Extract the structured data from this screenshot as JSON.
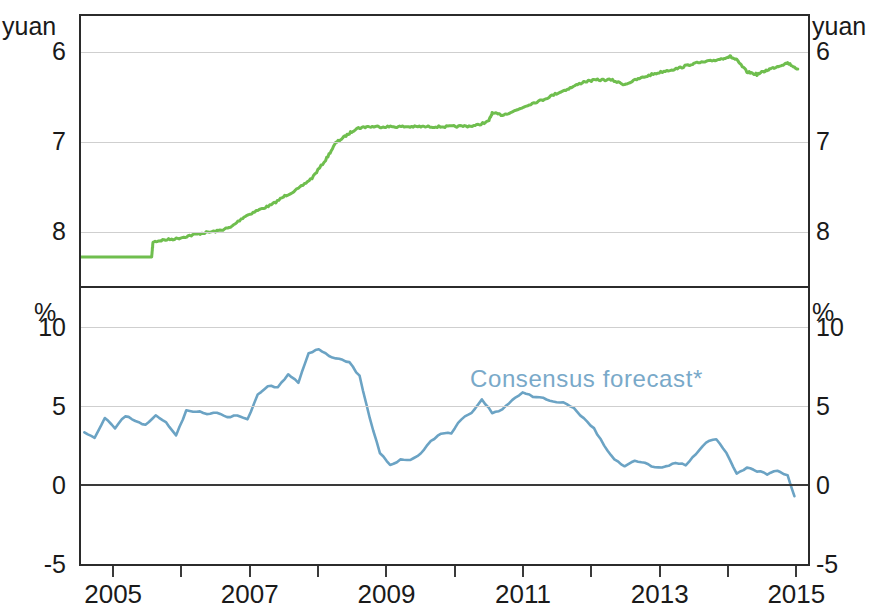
{
  "figure": {
    "left_unit_top": "yuan",
    "right_unit_top": "yuan",
    "left_unit_bottom": "%",
    "right_unit_bottom": "%"
  },
  "panel1": {
    "title": "Spot rate against US$, inverted scale",
    "yticks": [
      "6",
      "7",
      "8"
    ],
    "series_color": "#6fbe4e"
  },
  "panel2": {
    "title": "Appreciation in the next 12 months",
    "yticks": [
      "10",
      "5",
      "0",
      "-5"
    ],
    "legend": "Consensus forecast*",
    "series_color": "#6ba3c4"
  },
  "xaxis": {
    "labels": [
      "2005",
      "2007",
      "2009",
      "2011",
      "2013",
      "2015"
    ]
  },
  "chart_data": [
    {
      "type": "line",
      "title": "Spot rate against US$, inverted scale",
      "xlabel": "",
      "ylabel": "yuan",
      "ylim": [
        8.6,
        5.6
      ],
      "inverted_yaxis": true,
      "yticks": [
        6,
        7,
        8
      ],
      "xlim": [
        2004.5,
        2015.2
      ],
      "grid": true,
      "legend": "none",
      "series": [
        {
          "name": "CNY per US$ spot rate",
          "color": "#6fbe4e",
          "x": [
            2004.5,
            2004.7,
            2004.9,
            2005.1,
            2005.3,
            2005.54,
            2005.56,
            2005.7,
            2005.9,
            2006.1,
            2006.3,
            2006.5,
            2006.7,
            2006.9,
            2007.1,
            2007.3,
            2007.5,
            2007.7,
            2007.9,
            2008.1,
            2008.25,
            2008.4,
            2008.55,
            2008.7,
            2008.9,
            2009.1,
            2009.3,
            2009.5,
            2009.7,
            2009.9,
            2010.1,
            2010.3,
            2010.5,
            2010.55,
            2010.7,
            2010.9,
            2011.1,
            2011.3,
            2011.5,
            2011.7,
            2011.9,
            2012.1,
            2012.3,
            2012.5,
            2012.7,
            2012.9,
            2013.1,
            2013.3,
            2013.5,
            2013.7,
            2013.9,
            2014.05,
            2014.15,
            2014.3,
            2014.45,
            2014.6,
            2014.75,
            2014.9,
            2015.05
          ],
          "y": [
            8.277,
            8.277,
            8.277,
            8.277,
            8.277,
            8.277,
            8.11,
            8.09,
            8.075,
            8.04,
            8.01,
            7.99,
            7.95,
            7.83,
            7.76,
            7.7,
            7.6,
            7.52,
            7.4,
            7.2,
            7.01,
            6.93,
            6.85,
            6.83,
            6.83,
            6.83,
            6.83,
            6.83,
            6.83,
            6.83,
            6.825,
            6.82,
            6.77,
            6.68,
            6.7,
            6.65,
            6.58,
            6.53,
            6.46,
            6.4,
            6.33,
            6.31,
            6.31,
            6.36,
            6.3,
            6.25,
            6.21,
            6.18,
            6.13,
            6.11,
            6.08,
            6.05,
            6.09,
            6.22,
            6.25,
            6.2,
            6.16,
            6.12,
            6.19
          ]
        }
      ]
    },
    {
      "type": "line",
      "title": "Appreciation in the next 12 months",
      "xlabel": "",
      "ylabel": "%",
      "ylim": [
        -5,
        12.5
      ],
      "yticks": [
        -5,
        0,
        5,
        10
      ],
      "xlim": [
        2004.5,
        2015.2
      ],
      "grid": true,
      "zero_line": true,
      "annotations": [
        {
          "text": "Consensus forecast*",
          "x": 2011.3,
          "y": 7.6
        }
      ],
      "series": [
        {
          "name": "Consensus forecast*",
          "color": "#6ba3c4",
          "x": [
            2004.55,
            2004.7,
            2004.85,
            2005.0,
            2005.15,
            2005.3,
            2005.45,
            2005.6,
            2005.75,
            2005.9,
            2006.05,
            2006.2,
            2006.35,
            2006.5,
            2006.65,
            2006.8,
            2006.95,
            2007.1,
            2007.25,
            2007.4,
            2007.55,
            2007.7,
            2007.85,
            2008.0,
            2008.15,
            2008.3,
            2008.45,
            2008.6,
            2008.75,
            2008.9,
            2009.05,
            2009.2,
            2009.35,
            2009.5,
            2009.65,
            2009.8,
            2009.95,
            2010.1,
            2010.25,
            2010.4,
            2010.55,
            2010.7,
            2010.85,
            2011.0,
            2011.15,
            2011.3,
            2011.45,
            2011.6,
            2011.75,
            2011.9,
            2012.05,
            2012.2,
            2012.35,
            2012.5,
            2012.65,
            2012.8,
            2012.95,
            2013.1,
            2013.25,
            2013.4,
            2013.55,
            2013.7,
            2013.85,
            2014.0,
            2014.15,
            2014.3,
            2014.45,
            2014.6,
            2014.75,
            2014.9,
            2015.0
          ],
          "y": [
            3.4,
            3.0,
            4.3,
            3.6,
            4.4,
            4.1,
            3.8,
            4.4,
            4.0,
            3.2,
            4.7,
            4.7,
            4.5,
            4.6,
            4.3,
            4.4,
            4.2,
            5.7,
            6.3,
            6.2,
            7.0,
            6.5,
            8.4,
            8.6,
            8.2,
            8.0,
            7.8,
            6.9,
            4.2,
            2.0,
            1.3,
            1.6,
            1.6,
            2.0,
            2.8,
            3.3,
            3.3,
            4.2,
            4.6,
            5.4,
            4.6,
            4.8,
            5.4,
            5.9,
            5.6,
            5.5,
            5.3,
            5.2,
            4.9,
            4.2,
            3.6,
            2.5,
            1.6,
            1.2,
            1.5,
            1.4,
            1.1,
            1.2,
            1.4,
            1.3,
            2.0,
            2.7,
            2.9,
            2.0,
            0.7,
            1.1,
            0.9,
            0.7,
            0.9,
            0.6,
            -0.7
          ]
        }
      ]
    }
  ]
}
